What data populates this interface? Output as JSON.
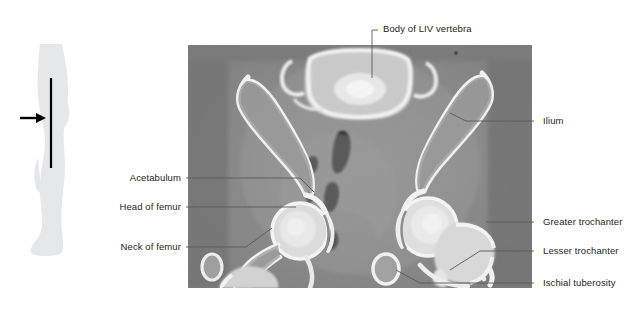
{
  "figure": {
    "modality": "CT"
  },
  "orientation_thumbnail": {
    "name": "lower-limb-silhouette",
    "description": "Grey silhouette of a lower limb with a vertical black line marking the scan level and a black arrow indicating the plane of section",
    "silhouette_color": "#e6e7e8",
    "marker_color": "#000000",
    "arrow_color": "#000000"
  },
  "ct_image": {
    "alt": "Axial CT section through the pelvis showing the body of the LIV vertebra, both ilia, hip joints, femoral heads and necks, greater and lesser trochanters and ischial tuberosities",
    "background_gray": "#8e8e8e",
    "bone_color": "#f2f2f2",
    "gas_color": "#000000"
  },
  "labels": {
    "top": [
      {
        "id": "body-of-liv-vertebra",
        "text": "Body of LIV vertebra"
      }
    ],
    "left": [
      {
        "id": "acetabulum",
        "text": "Acetabulum"
      },
      {
        "id": "head-of-femur",
        "text": "Head of femur"
      },
      {
        "id": "neck-of-femur",
        "text": "Neck of femur"
      }
    ],
    "right": [
      {
        "id": "ilium",
        "text": "Ilium"
      },
      {
        "id": "greater-trochanter",
        "text": "Greater trochanter"
      },
      {
        "id": "lesser-trochanter",
        "text": "Lesser trochanter"
      },
      {
        "id": "ischial-tuberosity",
        "text": "Ischial tuberosity"
      }
    ]
  },
  "colors": {
    "label_text": "#231f20",
    "leader_line": "#58595b",
    "page_background": "#ffffff"
  }
}
